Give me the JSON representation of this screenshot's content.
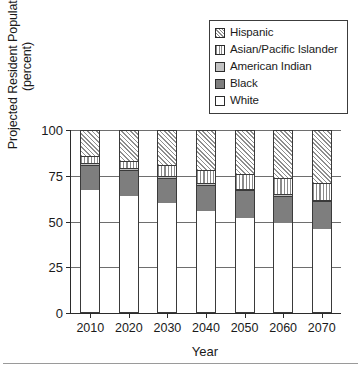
{
  "chart_data": {
    "type": "bar",
    "subtype": "stacked-bar-100",
    "title": "",
    "xlabel": "Year",
    "ylabel": "Projected Resident Population (percent)",
    "ylabel_line1": "Projected Resident Population",
    "ylabel_line2": "(percent)",
    "categories": [
      "2010",
      "2020",
      "2030",
      "2040",
      "2050",
      "2060",
      "2070"
    ],
    "ylim": [
      0,
      100
    ],
    "yticks": [
      "0",
      "25",
      "50",
      "75",
      "100"
    ],
    "ytick_values": [
      0,
      25,
      50,
      75,
      100
    ],
    "grid": "horizontal",
    "legend_position": "top-right",
    "stack_order_bottom_to_top": [
      "White",
      "Black",
      "American Indian",
      "Asian/Pacific Islander",
      "Hispanic"
    ],
    "series": [
      {
        "name": "White",
        "fill": "solid-white",
        "values": [
          67,
          64,
          60,
          56,
          52,
          49,
          46
        ]
      },
      {
        "name": "Black",
        "fill": "solid-dark-gray",
        "values": [
          14,
          14,
          14,
          14,
          15,
          15,
          15
        ]
      },
      {
        "name": "American Indian",
        "fill": "solid-light-gray",
        "values": [
          1,
          1,
          1,
          1,
          1,
          1,
          1
        ]
      },
      {
        "name": "Asian/Pacific Islander",
        "fill": "vertical-stripe",
        "values": [
          4,
          4,
          6,
          7,
          8,
          9,
          9
        ]
      },
      {
        "name": "Hispanic",
        "fill": "diagonal-hatch",
        "values": [
          14,
          17,
          19,
          22,
          24,
          26,
          29
        ]
      }
    ],
    "cumulative_tops": {
      "2010": {
        "White": 67,
        "Black": 81,
        "American Indian": 82,
        "Asian/Pacific Islander": 86,
        "Hispanic": 100
      },
      "2020": {
        "White": 64,
        "Black": 78,
        "American Indian": 79,
        "Asian/Pacific Islander": 83,
        "Hispanic": 100
      },
      "2030": {
        "White": 60,
        "Black": 74,
        "American Indian": 75,
        "Asian/Pacific Islander": 81,
        "Hispanic": 100
      },
      "2040": {
        "White": 56,
        "Black": 70,
        "American Indian": 71,
        "Asian/Pacific Islander": 78,
        "Hispanic": 100
      },
      "2050": {
        "White": 52,
        "Black": 67,
        "American Indian": 68,
        "Asian/Pacific Islander": 76,
        "Hispanic": 100
      },
      "2060": {
        "White": 49,
        "Black": 64,
        "American Indian": 65,
        "Asian/Pacific Islander": 74,
        "Hispanic": 100
      },
      "2070": {
        "White": 46,
        "Black": 61,
        "American Indian": 62,
        "Asian/Pacific Islander": 71,
        "Hispanic": 100
      }
    },
    "colors": {
      "white": "#ffffff",
      "black_series": "#7e7e7e",
      "american_indian": "#c2c2c2",
      "hatch_stroke": "#8e8e8e",
      "stripe_stroke": "#8a8a8a",
      "axis": "#2b2b2b",
      "gridline": "#6e6e6e",
      "text": "#1a1a1a"
    }
  },
  "legend": {
    "items": [
      {
        "label": "Hispanic",
        "swatch": "diagonal-hatch-swatch"
      },
      {
        "label": "Asian/Pacific Islander",
        "swatch": "vertical-stripe-swatch"
      },
      {
        "label": "American Indian",
        "swatch": "light-gray-swatch"
      },
      {
        "label": "Black",
        "swatch": "dark-gray-swatch"
      },
      {
        "label": "White",
        "swatch": "white-swatch"
      }
    ]
  },
  "footer": {
    "source_note": ""
  }
}
